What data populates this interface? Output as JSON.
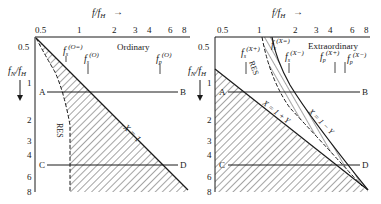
{
  "figure": {
    "panels": [
      {
        "id": "ordinary",
        "mode_label": "Ordinary",
        "x_axis_label": "f/f_H",
        "y_axis_label": "f_N/f_H",
        "x_ticks": [
          "0.5",
          "1",
          "2",
          "3",
          "4",
          "6",
          "8"
        ],
        "y_ticks": [
          "0.5",
          "1",
          "2",
          "3",
          "4",
          "6",
          "8"
        ],
        "markers": [
          {
            "label": "f_s",
            "sup": "(O=)"
          },
          {
            "label": "f_s",
            "sup": "(O)"
          },
          {
            "label": "f_p",
            "sup": "(O)"
          }
        ],
        "curve_labels": {
          "res": "RES",
          "x1": "X = 1"
        },
        "lines": [
          {
            "start": "A",
            "end": "B"
          },
          {
            "start": "C",
            "end": "D"
          }
        ]
      },
      {
        "id": "extraordinary",
        "mode_label": "Extraordinary",
        "x_axis_label": "f/f_H",
        "y_axis_label": "f_N/f_H",
        "x_ticks": [
          "0.5",
          "1",
          "2",
          "3",
          "4",
          "6",
          "8"
        ],
        "y_ticks": [
          "0.5",
          "1",
          "2",
          "3",
          "4",
          "6",
          "8"
        ],
        "markers": [
          {
            "label": "f_s",
            "sup": "(X+)"
          },
          {
            "label": "f_s",
            "sup": "(X=)"
          },
          {
            "label": "f_s",
            "sup": "(X−)"
          },
          {
            "label": "f_p",
            "sup": "(X+)"
          },
          {
            "label": "f_p",
            "sup": "(X−)"
          }
        ],
        "curve_labels": {
          "res": "RES",
          "x1py": "X = 1 + Y",
          "x1my": "X = 1 − Y"
        },
        "lines": [
          {
            "start": "A",
            "end": "B"
          },
          {
            "start": "C",
            "end": "D"
          }
        ]
      }
    ],
    "text": {
      "x_axis_main": "f/f",
      "x_axis_sub": "H",
      "y_axis_main": "f",
      "y_axis_sub1": "N",
      "y_axis_mid": "/f",
      "y_axis_sub2": "H",
      "arrow": "→"
    },
    "colors": {
      "ink": "#1a1a1a",
      "background": "#ffffff"
    }
  }
}
